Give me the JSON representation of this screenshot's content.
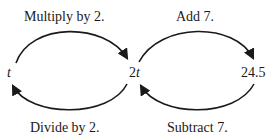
{
  "diagram": {
    "nodes": {
      "left": "t",
      "middle_coef": "2",
      "middle_var": "t",
      "right": "24.5"
    },
    "arrows": {
      "top_left": "Multiply by 2.",
      "bottom_left": "Divide by 2.",
      "top_right": "Add 7.",
      "bottom_right": "Subtract 7."
    },
    "colors": {
      "stroke": "#1a1a1a"
    }
  }
}
